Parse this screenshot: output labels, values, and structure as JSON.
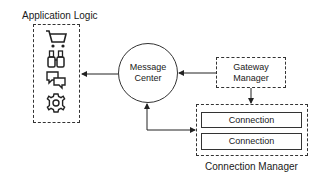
{
  "diagram": {
    "application_logic": {
      "title": "Application Logic",
      "icons": [
        "shopping-cart-icon",
        "binoculars-icon",
        "chat-bubbles-icon",
        "gear-icon"
      ]
    },
    "message_center": {
      "line1": "Message",
      "line2": "Center"
    },
    "gateway_manager": {
      "line1": "Gateway",
      "line2": "Manager"
    },
    "connection_manager": {
      "title": "Connection Manager",
      "connections": [
        "Connection",
        "Connection"
      ]
    },
    "edges": [
      {
        "from": "Message Center",
        "to": "Application Logic"
      },
      {
        "from": "Gateway Manager",
        "to": "Message Center"
      },
      {
        "from": "Gateway Manager",
        "to": "Connection Manager"
      },
      {
        "from": "Message Center",
        "to": "Connection Manager",
        "bidirectional": true
      }
    ]
  }
}
